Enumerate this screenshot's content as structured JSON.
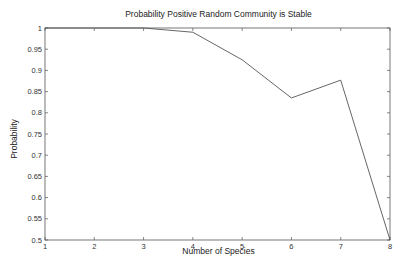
{
  "chart_data": {
    "type": "line",
    "title": "Probability Positive Random Community is Stable",
    "xlabel": "Number of Species",
    "ylabel": "Probability",
    "x": [
      1,
      2,
      3,
      4,
      5,
      6,
      7,
      8
    ],
    "series": [
      {
        "name": "Probability",
        "values": [
          1.0,
          1.0,
          1.0,
          0.99,
          0.925,
          0.835,
          0.877,
          0.5
        ]
      }
    ],
    "xlim": [
      1,
      8
    ],
    "ylim": [
      0.5,
      1
    ],
    "xticks": [
      "1",
      "2",
      "3",
      "4",
      "5",
      "6",
      "7",
      "8"
    ],
    "yticks": [
      "0.5",
      "0.55",
      "0.6",
      "0.65",
      "0.7",
      "0.75",
      "0.8",
      "0.85",
      "0.9",
      "0.95",
      "1"
    ],
    "grid": false,
    "legend": null,
    "line_color": "#555555"
  }
}
